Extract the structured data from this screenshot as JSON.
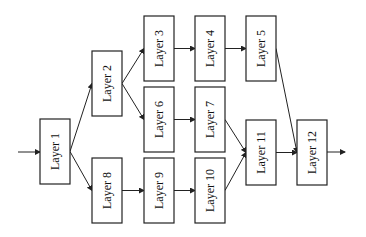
{
  "diagram": {
    "colors": {
      "stroke": "#222222",
      "background": "#ffffff",
      "text": "#111111"
    },
    "nodes": [
      {
        "id": "L1",
        "label": "Layer 1",
        "x": 40,
        "y": 119,
        "w": 30,
        "h": 65
      },
      {
        "id": "L2",
        "label": "Layer 2",
        "x": 92,
        "y": 51,
        "w": 30,
        "h": 65
      },
      {
        "id": "L3",
        "label": "Layer 3",
        "x": 144,
        "y": 16,
        "w": 30,
        "h": 65
      },
      {
        "id": "L4",
        "label": "Layer 4",
        "x": 195,
        "y": 16,
        "w": 30,
        "h": 65
      },
      {
        "id": "L5",
        "label": "Layer 5",
        "x": 246,
        "y": 16,
        "w": 30,
        "h": 65
      },
      {
        "id": "L6",
        "label": "Layer 6",
        "x": 144,
        "y": 87,
        "w": 30,
        "h": 65
      },
      {
        "id": "L7",
        "label": "Layer 7",
        "x": 195,
        "y": 87,
        "w": 30,
        "h": 65
      },
      {
        "id": "L8",
        "label": "Layer 8",
        "x": 92,
        "y": 158,
        "w": 30,
        "h": 65
      },
      {
        "id": "L9",
        "label": "Layer 9",
        "x": 144,
        "y": 158,
        "w": 30,
        "h": 65
      },
      {
        "id": "L10",
        "label": "Layer 10",
        "x": 195,
        "y": 158,
        "w": 30,
        "h": 65
      },
      {
        "id": "L11",
        "label": "Layer 11",
        "x": 246,
        "y": 120,
        "w": 30,
        "h": 65
      },
      {
        "id": "L12",
        "label": "Layer 12",
        "x": 297,
        "y": 120,
        "w": 30,
        "h": 65
      }
    ],
    "edges": [
      {
        "from": "input",
        "to": "L1"
      },
      {
        "from": "L1",
        "to": "L2"
      },
      {
        "from": "L1",
        "to": "L8"
      },
      {
        "from": "L2",
        "to": "L3"
      },
      {
        "from": "L2",
        "to": "L6"
      },
      {
        "from": "L3",
        "to": "L4"
      },
      {
        "from": "L4",
        "to": "L5"
      },
      {
        "from": "L5",
        "to": "L12"
      },
      {
        "from": "L6",
        "to": "L7"
      },
      {
        "from": "L7",
        "to": "L11"
      },
      {
        "from": "L8",
        "to": "L9"
      },
      {
        "from": "L9",
        "to": "L10"
      },
      {
        "from": "L10",
        "to": "L11"
      },
      {
        "from": "L11",
        "to": "L12"
      },
      {
        "from": "L12",
        "to": "output"
      }
    ],
    "input_arrow": {
      "x1": 18,
      "y1": 152,
      "x2": 40,
      "y2": 152
    },
    "output_arrow": {
      "x1": 327,
      "y1": 152,
      "x2": 345,
      "y2": 152
    }
  }
}
